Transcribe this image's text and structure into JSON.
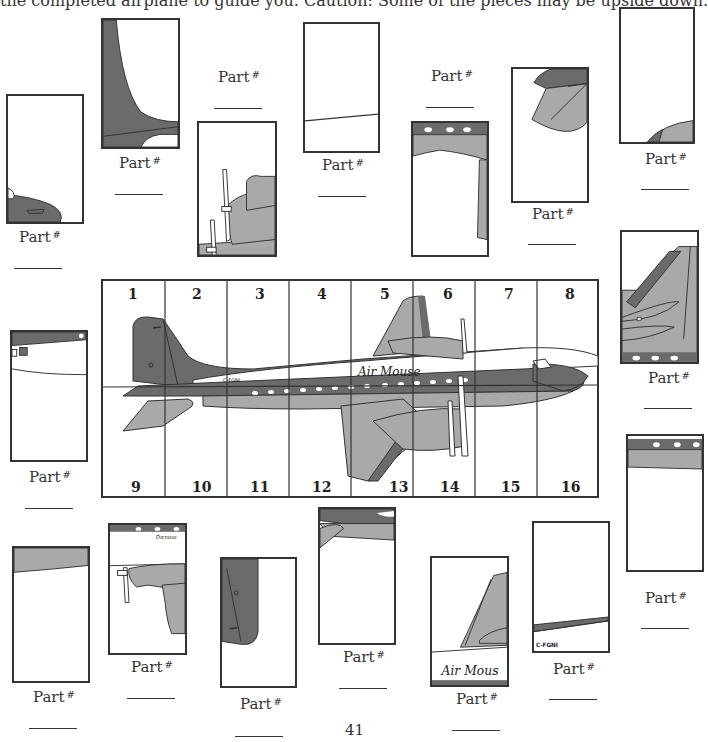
{
  "instructions": "the completed airplane to guide you. Caution: Some of the pieces may be upside down.",
  "part_label": "Part",
  "part_symbol": "#",
  "page_number": "41",
  "grid": {
    "top_numbers": [
      "1",
      "2",
      "3",
      "4",
      "5",
      "6",
      "7",
      "8"
    ],
    "bottom_numbers": [
      "9",
      "10",
      "11",
      "12",
      "13",
      "14",
      "15",
      "16"
    ],
    "registration": "C-FGNI",
    "airline_name": "Air Mouse"
  },
  "colors": {
    "dark_gray": "#6b6b6b",
    "light_gray": "#a9a9a9",
    "outline": "#333333"
  },
  "pieces": [
    {
      "id": "p-a",
      "answer": ""
    },
    {
      "id": "p-b",
      "answer": ""
    },
    {
      "id": "p-c",
      "answer": ""
    },
    {
      "id": "p-d",
      "answer": ""
    },
    {
      "id": "p-e",
      "answer": ""
    },
    {
      "id": "p-f",
      "answer": ""
    },
    {
      "id": "p-g",
      "answer": ""
    },
    {
      "id": "p-h",
      "answer": ""
    },
    {
      "id": "p-i",
      "answer": ""
    },
    {
      "id": "p-j",
      "answer": ""
    },
    {
      "id": "p-k",
      "answer": ""
    },
    {
      "id": "p-l",
      "answer": ""
    },
    {
      "id": "p-m",
      "answer": ""
    },
    {
      "id": "p-n",
      "answer": ""
    },
    {
      "id": "p-o",
      "answer": ""
    },
    {
      "id": "p-p",
      "answer": ""
    }
  ]
}
